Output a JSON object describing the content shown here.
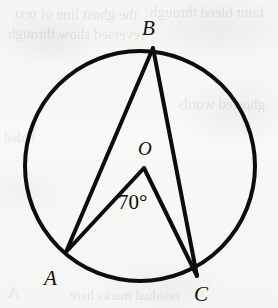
{
  "figure": {
    "kind": "circle-geometry-diagram",
    "background_color": "#f6f6f4",
    "ink_color": "#0d0d0d",
    "stroke_width": 4,
    "canvas": {
      "width": 278,
      "height": 308
    }
  },
  "circle": {
    "name": "circle-O",
    "center": {
      "x": 140,
      "y": 166
    },
    "radius": 115,
    "label": "O"
  },
  "points": [
    {
      "id": "B",
      "label": "B",
      "x": 153,
      "y": 48,
      "on_circle": true
    },
    {
      "id": "A",
      "label": "A",
      "x": 66,
      "y": 252,
      "on_circle": true
    },
    {
      "id": "C",
      "label": "C",
      "x": 197,
      "y": 276,
      "on_circle": true
    },
    {
      "id": "O",
      "label": "O",
      "x": 144,
      "y": 168,
      "on_circle": false
    }
  ],
  "segments": [
    {
      "id": "BA",
      "from": "B",
      "to": "A",
      "role": "chord"
    },
    {
      "id": "BC",
      "from": "B",
      "to": "C",
      "role": "chord"
    },
    {
      "id": "OA",
      "from": "O",
      "to": "A",
      "role": "radius"
    },
    {
      "id": "OC",
      "from": "O",
      "to": "C",
      "role": "radius"
    }
  ],
  "angles": [
    {
      "id": "AOC",
      "vertex": "O",
      "rays": [
        "A",
        "C"
      ],
      "value": "70°",
      "label_position": {
        "x": 138,
        "y": 205
      }
    }
  ],
  "ghost_text": [
    {
      "text": "the ghost line of text",
      "x": 14,
      "y": 6,
      "size": 15,
      "rotate": -0.6
    },
    {
      "text": "faint bleed through",
      "x": 150,
      "y": 4,
      "size": 15,
      "rotate": -0.4
    },
    {
      "text": "reversed show through",
      "x": 8,
      "y": 26,
      "size": 15,
      "rotate": -0.5
    },
    {
      "text": "ghosted words",
      "x": 178,
      "y": 96,
      "size": 15,
      "rotate": -0.3
    },
    {
      "text": "faded",
      "x": 4,
      "y": 130,
      "size": 14,
      "rotate": 0.2
    },
    {
      "text": "residual marks here",
      "x": 70,
      "y": 288,
      "size": 14,
      "rotate": -0.3
    },
    {
      "text": "A",
      "x": 8,
      "y": 284,
      "size": 16,
      "rotate": 0
    }
  ]
}
